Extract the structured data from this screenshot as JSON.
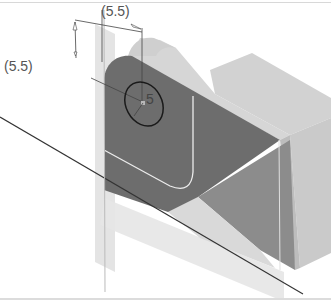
{
  "figure": {
    "type": "isometric CAD sketch view",
    "dimensions": [
      {
        "id": "horizontal-offset",
        "label": "(5.5)"
      },
      {
        "id": "vertical-offset",
        "label": "(5.5)"
      },
      {
        "id": "hole-diameter",
        "label": "5"
      }
    ],
    "colors": {
      "sketch_face": "#6e6e6e",
      "top_face": "#d4d4d4",
      "side_face": "#c4c4c4",
      "inner_shadow": "#8a8a8a",
      "sketch_plane": "#e2e2e2",
      "sketch_line": "#1a1a1a",
      "fillet_edge": "#e8e8e8"
    }
  }
}
